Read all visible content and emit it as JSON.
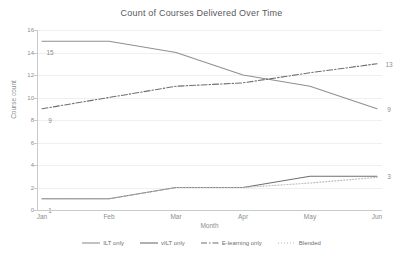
{
  "chart_data": {
    "type": "line",
    "title": "Count of Courses Delivered Over Time",
    "xlabel": "Month",
    "ylabel": "Course count",
    "categories": [
      "Jan",
      "Feb",
      "Mar",
      "Apr",
      "May",
      "Jun"
    ],
    "ylim": [
      0,
      16
    ],
    "yticks": [
      0,
      2,
      4,
      6,
      8,
      10,
      12,
      14,
      16
    ],
    "grid": true,
    "legend_position": "bottom",
    "series": [
      {
        "name": "ILT only",
        "style": "solid",
        "color": "#8e9092",
        "values": [
          15,
          15,
          14,
          12,
          11,
          9
        ],
        "start_label": "15",
        "end_label": "9"
      },
      {
        "name": "vILT only",
        "style": "solid",
        "color": "#6d6f71",
        "values": [
          1,
          1,
          2,
          2,
          3,
          3
        ],
        "start_label": "1",
        "end_label": "3"
      },
      {
        "name": "E-learning only",
        "style": "dashdot",
        "color": "#6d6f71",
        "values": [
          9,
          10,
          11,
          11.3,
          12.2,
          13
        ],
        "start_label": "9",
        "end_label": "13"
      },
      {
        "name": "Blended",
        "style": "dotted",
        "color": "#b9babc",
        "values": [
          1,
          1,
          2,
          2,
          2.4,
          2.9
        ],
        "start_label": "",
        "end_label": ""
      }
    ]
  }
}
